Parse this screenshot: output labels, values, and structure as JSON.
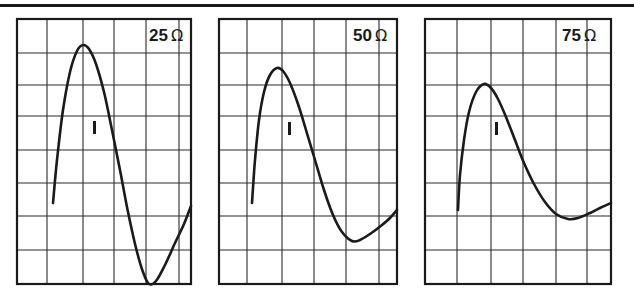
{
  "figure": {
    "panels": [
      {
        "id": "panel-25",
        "resistance_value": "25",
        "resistance_unit": "Ω",
        "marker": "I",
        "frame": {
          "x1": 17,
          "y1": 19,
          "x2": 191,
          "y2": 284
        },
        "vertical_gridlines": [
          47,
          83,
          114,
          146,
          179
        ],
        "horizontal_gridlines": [
          53,
          85,
          116,
          150,
          183,
          216,
          250
        ],
        "curve_points": [
          [
            53,
            203
          ],
          [
            57,
            160
          ],
          [
            63,
            110
          ],
          [
            70,
            72
          ],
          [
            77,
            51
          ],
          [
            83,
            45
          ],
          [
            89,
            49
          ],
          [
            96,
            64
          ],
          [
            104,
            92
          ],
          [
            112,
            130
          ],
          [
            120,
            170
          ],
          [
            128,
            212
          ],
          [
            136,
            248
          ],
          [
            143,
            272
          ],
          [
            149,
            284
          ],
          [
            156,
            281
          ],
          [
            165,
            265
          ],
          [
            175,
            243
          ],
          [
            184,
            224
          ],
          [
            191,
            206
          ]
        ],
        "label_pos": {
          "x": 149,
          "y": 27
        },
        "marker_pos": {
          "x": 93,
          "y": 121
        }
      },
      {
        "id": "panel-50",
        "resistance_value": "50",
        "resistance_unit": "Ω",
        "marker": "I",
        "frame": {
          "x1": 219,
          "y1": 19,
          "x2": 397,
          "y2": 284
        },
        "vertical_gridlines": [
          247,
          282,
          314,
          346,
          379
        ],
        "horizontal_gridlines": [
          53,
          85,
          116,
          150,
          183,
          216,
          250
        ],
        "curve_points": [
          [
            252,
            203
          ],
          [
            255,
            160
          ],
          [
            259,
            120
          ],
          [
            264,
            92
          ],
          [
            270,
            75
          ],
          [
            277,
            68
          ],
          [
            283,
            71
          ],
          [
            290,
            83
          ],
          [
            298,
            104
          ],
          [
            306,
            130
          ],
          [
            315,
            160
          ],
          [
            324,
            190
          ],
          [
            333,
            215
          ],
          [
            342,
            232
          ],
          [
            352,
            241
          ],
          [
            360,
            240
          ],
          [
            370,
            234
          ],
          [
            382,
            225
          ],
          [
            390,
            218
          ],
          [
            397,
            210
          ]
        ],
        "label_pos": {
          "x": 353,
          "y": 27
        },
        "marker_pos": {
          "x": 288,
          "y": 122
        }
      },
      {
        "id": "panel-75",
        "resistance_value": "75",
        "resistance_unit": "Ω",
        "marker": "I",
        "frame": {
          "x1": 425,
          "y1": 19,
          "x2": 611,
          "y2": 284
        },
        "vertical_gridlines": [
          457,
          491,
          523,
          556,
          587
        ],
        "horizontal_gridlines": [
          53,
          85,
          116,
          150,
          183,
          216,
          250
        ],
        "curve_points": [
          [
            458,
            210
          ],
          [
            460,
            175
          ],
          [
            464,
            140
          ],
          [
            469,
            112
          ],
          [
            476,
            92
          ],
          [
            484,
            84
          ],
          [
            491,
            88
          ],
          [
            498,
            99
          ],
          [
            506,
            117
          ],
          [
            515,
            140
          ],
          [
            524,
            163
          ],
          [
            534,
            184
          ],
          [
            545,
            202
          ],
          [
            556,
            214
          ],
          [
            568,
            219
          ],
          [
            578,
            218
          ],
          [
            590,
            213
          ],
          [
            600,
            208
          ],
          [
            611,
            203
          ]
        ],
        "label_pos": {
          "x": 562,
          "y": 27
        },
        "marker_pos": {
          "x": 495,
          "y": 122
        }
      }
    ],
    "colors": {
      "ink": "#1a1a1a",
      "grid": "#2a2a2a",
      "background": "#ffffff"
    }
  }
}
